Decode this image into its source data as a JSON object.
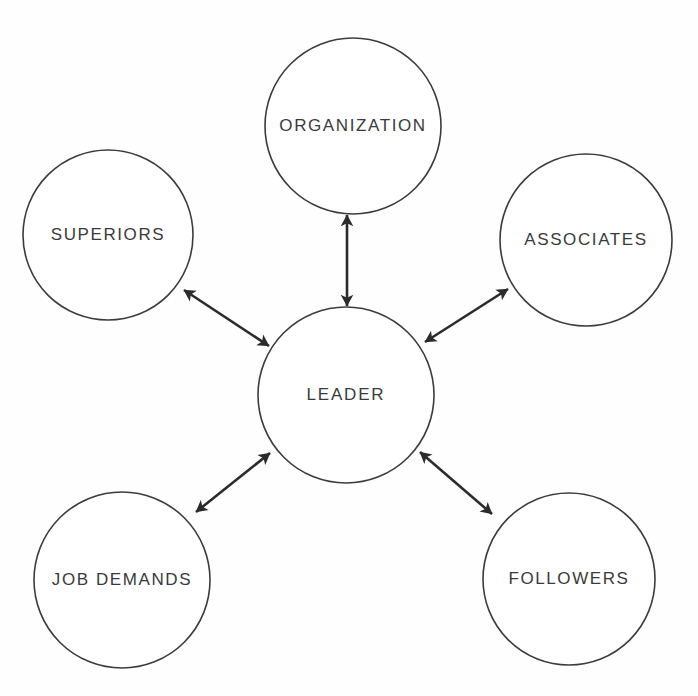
{
  "diagram": {
    "background_color": "#fefefe",
    "line_color": "#2b2b2d",
    "circle_stroke_color": "#3c3c3e",
    "text_color": "#3a3a3c",
    "center_node": {
      "id": "leader",
      "label": "LEADER",
      "cx": 346,
      "cy": 395,
      "r": 88,
      "font_size": 17,
      "letter_spacing": 1.8
    },
    "outer_nodes": [
      {
        "id": "organization",
        "label": "ORGANIZATION",
        "cx": 353,
        "cy": 126,
        "r": 88,
        "font_size": 17,
        "letter_spacing": 1.6,
        "position": "top"
      },
      {
        "id": "superiors",
        "label": "SUPERIORS",
        "cx": 108,
        "cy": 235,
        "r": 85,
        "font_size": 17,
        "letter_spacing": 1.6,
        "position": "upper-left"
      },
      {
        "id": "associates",
        "label": "ASSOCIATES",
        "cx": 586,
        "cy": 240,
        "r": 86,
        "font_size": 17,
        "letter_spacing": 1.6,
        "position": "upper-right"
      },
      {
        "id": "job-demands",
        "label": "JOB DEMANDS",
        "cx": 122,
        "cy": 580,
        "r": 88,
        "font_size": 17,
        "letter_spacing": 1.6,
        "position": "lower-left"
      },
      {
        "id": "followers",
        "label": "FOLLOWERS",
        "cx": 569,
        "cy": 579,
        "r": 86,
        "font_size": 17,
        "letter_spacing": 1.6,
        "position": "lower-right"
      }
    ],
    "connectors": [
      {
        "id": "leader-organization",
        "from": "leader",
        "to": "organization",
        "arrowheads": "both",
        "x1": 347,
        "y1": 306,
        "x2": 347,
        "y2": 215
      },
      {
        "id": "leader-superiors",
        "from": "leader",
        "to": "superiors",
        "arrowheads": "both",
        "x1": 269,
        "y1": 346,
        "x2": 184,
        "y2": 290
      },
      {
        "id": "leader-associates",
        "from": "leader",
        "to": "associates",
        "arrowheads": "both",
        "x1": 425,
        "y1": 342,
        "x2": 508,
        "y2": 289
      },
      {
        "id": "leader-job-demands",
        "from": "leader",
        "to": "job-demands",
        "arrowheads": "both",
        "x1": 270,
        "y1": 453,
        "x2": 196,
        "y2": 512
      },
      {
        "id": "leader-followers",
        "from": "leader",
        "to": "followers",
        "arrowheads": "both",
        "x1": 420,
        "y1": 452,
        "x2": 492,
        "y2": 514
      }
    ]
  }
}
